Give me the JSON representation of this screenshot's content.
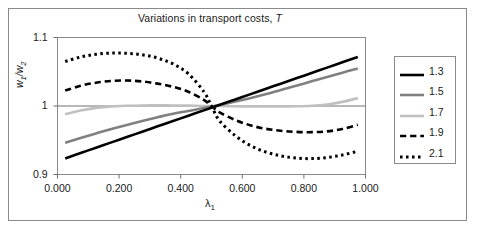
{
  "figure": {
    "background_color": "#ffffff",
    "frame_color": "#8a8a8a"
  },
  "chart_data": {
    "type": "line",
    "title": "Variations in transport costs, T",
    "title_plain": "Variations in transport costs,",
    "title_italic": "T",
    "xlabel": "λ",
    "xlabel_sub": "1",
    "ylabel": "w",
    "ylabel_sub1": "1",
    "ylabel_sep": "/w",
    "ylabel_sub2": "2",
    "xlim": [
      0.0,
      1.0
    ],
    "ylim": [
      0.9,
      1.1
    ],
    "xticks": [
      0.0,
      0.2,
      0.4,
      0.6,
      0.8,
      1.0
    ],
    "xtick_labels": [
      "0.000",
      "0.200",
      "0.400",
      "0.600",
      "0.800",
      "1.000"
    ],
    "yticks": [
      0.9,
      1.0,
      1.1
    ],
    "ytick_labels": [
      "0.9",
      "1",
      "1.1"
    ],
    "grid": false,
    "zero_line_value": 1.0,
    "legend_position": "right-outside",
    "legend_title": "",
    "x": [
      0.025,
      0.075,
      0.125,
      0.175,
      0.225,
      0.275,
      0.325,
      0.375,
      0.425,
      0.475,
      0.5,
      0.525,
      0.575,
      0.625,
      0.675,
      0.725,
      0.775,
      0.825,
      0.875,
      0.925,
      0.975
    ],
    "series": [
      {
        "name": "1.3",
        "label": "1.3",
        "color": "#000000",
        "style": "solid",
        "width": 2.6,
        "values": [
          0.9235,
          0.9313,
          0.9391,
          0.9469,
          0.9547,
          0.9625,
          0.9703,
          0.9781,
          0.9858,
          0.9936,
          0.9975,
          1.0014,
          1.0092,
          1.017,
          1.0248,
          1.0326,
          1.0404,
          1.0482,
          1.056,
          1.0638,
          1.0716
        ]
      },
      {
        "name": "1.5",
        "label": "1.5",
        "color": "#808080",
        "style": "solid",
        "width": 2.6,
        "values": [
          0.9465,
          0.9534,
          0.96,
          0.9663,
          0.9723,
          0.9781,
          0.9836,
          0.9888,
          0.9927,
          0.997,
          0.9992,
          1.0014,
          1.0061,
          1.0113,
          1.017,
          1.0232,
          1.0295,
          1.036,
          1.0424,
          1.0487,
          1.0548
        ]
      },
      {
        "name": "1.7",
        "label": "1.7",
        "color": "#c0c0c0",
        "style": "solid",
        "width": 2.6,
        "values": [
          0.988,
          0.9935,
          0.9973,
          0.9995,
          1.0004,
          1.0008,
          1.0009,
          1.0008,
          1.0005,
          1.0001,
          1.0,
          0.9999,
          0.9996,
          0.9994,
          0.9992,
          0.9993,
          0.9996,
          1.0004,
          1.0023,
          1.006,
          1.0115
        ]
      },
      {
        "name": "1.9",
        "label": "1.9",
        "color": "#000000",
        "style": "dashed",
        "width": 2.6,
        "values": [
          1.0225,
          1.0295,
          1.034,
          1.0366,
          1.0372,
          1.0358,
          1.0327,
          1.028,
          1.0208,
          1.009,
          1.0,
          0.991,
          0.98,
          0.972,
          0.9668,
          0.9638,
          0.9622,
          0.9618,
          0.963,
          0.9665,
          0.9725
        ]
      },
      {
        "name": "2.1",
        "label": "2.1",
        "color": "#000000",
        "style": "dotted",
        "width": 3.0,
        "values": [
          1.065,
          1.0715,
          1.0755,
          1.0772,
          1.077,
          1.0748,
          1.07,
          1.0615,
          1.047,
          1.021,
          1.0,
          0.979,
          0.9575,
          0.9425,
          0.933,
          0.9272,
          0.924,
          0.9232,
          0.9248,
          0.9285,
          0.934
        ]
      }
    ]
  }
}
